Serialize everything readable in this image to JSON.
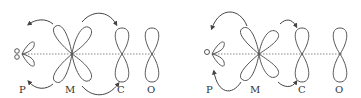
{
  "figure": {
    "colors": {
      "stroke": "#555555",
      "axis": "#888888",
      "text": "#333333",
      "background": "#ffffff"
    },
    "panels": [
      {
        "id": "left",
        "labels": {
          "p": "P",
          "m": "M",
          "c": "C",
          "o": "O"
        }
      },
      {
        "id": "right",
        "labels": {
          "p": "P",
          "m": "M",
          "c": "C",
          "o": "O"
        }
      }
    ]
  }
}
